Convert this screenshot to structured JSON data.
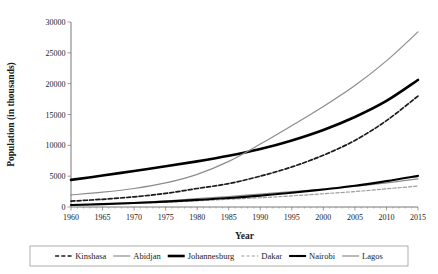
{
  "chart_data": {
    "type": "line",
    "title": "",
    "xlabel": "Year",
    "ylabel": "Population (in thousands)",
    "xlim": [
      1960,
      2015
    ],
    "ylim": [
      0,
      30000
    ],
    "xticks": [
      1960,
      1965,
      1970,
      1975,
      1980,
      1985,
      1990,
      1995,
      2000,
      2005,
      2010,
      2015
    ],
    "yticks": [
      0,
      5000,
      10000,
      15000,
      20000,
      25000,
      30000
    ],
    "xtick_labels": [
      "1960",
      "1965",
      "1970",
      "1975",
      "1980",
      "1985",
      "1990",
      "1995",
      "2000",
      "2005",
      "2010",
      "2015"
    ],
    "ytick_labels": [
      "0",
      "5000",
      "10000",
      "15000",
      "20000",
      "25000",
      "30000"
    ],
    "grid": false,
    "legend_position": "bottom",
    "minor_ticks_x": true,
    "x": [
      1960,
      1965,
      1970,
      1975,
      1980,
      1985,
      1990,
      1995,
      2000,
      2005,
      2010,
      2015
    ],
    "series": [
      {
        "name": "Kinshasa",
        "color": "#1a1a1a",
        "width": 1.7,
        "dash": "4,2.2",
        "values": [
          950,
          1250,
          1650,
          2200,
          3000,
          3800,
          5000,
          6500,
          8400,
          10800,
          14000,
          18000
        ]
      },
      {
        "name": "Abidjan",
        "color": "#8c8c8c",
        "width": 1.2,
        "dash": "none",
        "values": [
          350,
          500,
          720,
          980,
          1350,
          1700,
          2100,
          2500,
          2900,
          3350,
          3900,
          4550
        ]
      },
      {
        "name": "Johannesburg",
        "color": "#000000",
        "width": 2.6,
        "dash": "none",
        "values": [
          4400,
          5100,
          5850,
          6600,
          7400,
          8300,
          9400,
          10800,
          12500,
          14600,
          17200,
          20600
        ]
      },
      {
        "name": "Dakar",
        "color": "#9e9e9e",
        "width": 1.2,
        "dash": "3.2,2",
        "values": [
          300,
          420,
          580,
          780,
          1000,
          1250,
          1500,
          1800,
          2150,
          2500,
          2950,
          3400
        ]
      },
      {
        "name": "Nairobi",
        "color": "#000000",
        "width": 2.1,
        "dash": "none",
        "values": [
          330,
          470,
          650,
          870,
          1150,
          1450,
          1850,
          2300,
          2850,
          3450,
          4200,
          5050
        ]
      },
      {
        "name": "Lagos",
        "color": "#8c8c8c",
        "width": 1.2,
        "dash": "none",
        "values": [
          1950,
          2400,
          3000,
          3900,
          5300,
          7400,
          10200,
          13200,
          16300,
          19700,
          23700,
          28400
        ]
      }
    ]
  },
  "axes": {
    "x_title": "Year",
    "y_title": "Population (in thousands)"
  },
  "legend": {
    "items": [
      {
        "label": "Kinshasa"
      },
      {
        "label": "Abidjan"
      },
      {
        "label": "Johannesburg"
      },
      {
        "label": "Dakar"
      },
      {
        "label": "Nairobi"
      },
      {
        "label": "Lagos"
      }
    ]
  },
  "colors": {
    "background": "#ffffff",
    "axis": "#555555",
    "text": "#1a1a1a",
    "legend_border": "#9a9a9a"
  }
}
